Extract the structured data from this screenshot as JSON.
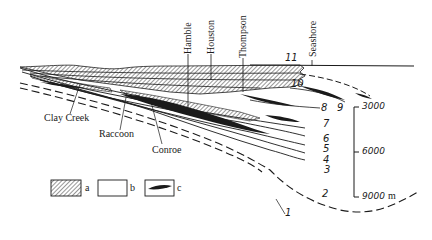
{
  "diagram": {
    "type": "geological cross-section",
    "wells": [
      {
        "name": "Hamble"
      },
      {
        "name": "Houston"
      },
      {
        "name": "Thompson"
      },
      {
        "name": "Seashore"
      }
    ],
    "fields": [
      {
        "name": "Clay Creek"
      },
      {
        "name": "Raccoon"
      },
      {
        "name": "Conroe"
      }
    ],
    "layer_numbers": [
      "1",
      "2",
      "3",
      "4",
      "5",
      "6",
      "7",
      "8",
      "9",
      "10",
      "11"
    ],
    "depth_scale": {
      "ticks": [
        "3000",
        "6000",
        "9000"
      ],
      "unit": "m"
    },
    "legend": [
      {
        "key": "a",
        "pattern": "hatched"
      },
      {
        "key": "b",
        "pattern": "blank"
      },
      {
        "key": "c",
        "pattern": "black lens"
      }
    ],
    "colors": {
      "ink": "#1a1a1a",
      "background": "#ffffff"
    }
  }
}
